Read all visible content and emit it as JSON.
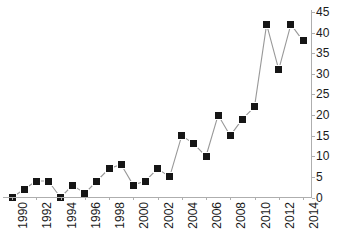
{
  "chart_data": {
    "type": "line",
    "title": "",
    "subtitle": "",
    "xlabel": "",
    "ylabel": "",
    "x": [
      1990,
      1991,
      1992,
      1993,
      1994,
      1995,
      1996,
      1997,
      1998,
      1999,
      2000,
      2001,
      2002,
      2003,
      2004,
      2005,
      2006,
      2007,
      2008,
      2009,
      2010,
      2011,
      2012,
      2013,
      2014
    ],
    "values": [
      0,
      2,
      4,
      4,
      0,
      3,
      1,
      4,
      7,
      8,
      3,
      4,
      7,
      5,
      15,
      13,
      10,
      20,
      15,
      19,
      22,
      42,
      31,
      42,
      38
    ],
    "series": [
      {
        "name": "",
        "values": [
          0,
          2,
          4,
          4,
          0,
          3,
          1,
          4,
          7,
          8,
          3,
          4,
          7,
          5,
          15,
          13,
          10,
          20,
          15,
          19,
          22,
          42,
          31,
          42,
          38
        ]
      }
    ],
    "x_tick_labels": [
      "1990",
      "1992",
      "1994",
      "1996",
      "1998",
      "2000",
      "2002",
      "2004",
      "2006",
      "2008",
      "2010",
      "2012",
      "2014"
    ],
    "x_tick_values": [
      1990,
      1992,
      1994,
      1996,
      1998,
      2000,
      2002,
      2004,
      2006,
      2008,
      2010,
      2012,
      2014
    ],
    "y_tick_labels": [
      "0",
      "5",
      "10",
      "15",
      "20",
      "25",
      "30",
      "35",
      "40",
      "45"
    ],
    "y_tick_values": [
      0,
      5,
      10,
      15,
      20,
      25,
      30,
      35,
      40,
      45
    ],
    "xlim": [
      1989.5,
      2014.8
    ],
    "ylim": [
      0,
      45
    ],
    "grid": false,
    "legend": false,
    "legend_position": "none",
    "y_axis_side": "right",
    "marker": "filled-square",
    "marker_color": "#161616",
    "line_color": "#999999",
    "axis_color": "#aeaeae",
    "text_color": "#1a1a1a",
    "background_color": "#ffffff",
    "x_tick_label_rotation": 90
  }
}
